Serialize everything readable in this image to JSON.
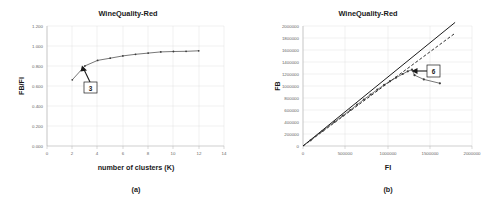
{
  "figure": {
    "name": "two-panel-figure",
    "background_color": "#ffffff",
    "text_color": "#1a1a1a",
    "grid_color": "#d9d9d9",
    "series_color": "#3c3c3c"
  },
  "chart_data": [
    {
      "panel": "a",
      "type": "line",
      "title": "WineQuality-Red",
      "caption": "(a)",
      "xlabel": "number of clusters (K)",
      "ylabel": "FB/FI",
      "xlim": [
        0,
        14
      ],
      "ylim": [
        0.0,
        1.2
      ],
      "grid": true,
      "legend": "none",
      "xticks": [
        0,
        2,
        4,
        6,
        8,
        10,
        12,
        14
      ],
      "xtick_labels": [
        "0",
        "2",
        "4",
        "6",
        "8",
        "10",
        "12",
        "14"
      ],
      "yticks": [
        0.0,
        0.2,
        0.4,
        0.6,
        0.8,
        1.0,
        1.2
      ],
      "ytick_labels": [
        "0.000",
        "0.200",
        "0.400",
        "0.600",
        "0.800",
        "1.000",
        "1.200"
      ],
      "x": [
        2,
        3,
        4,
        5,
        6,
        7,
        8,
        9,
        10,
        11,
        12
      ],
      "values": [
        0.662,
        0.801,
        0.856,
        0.878,
        0.901,
        0.917,
        0.929,
        0.941,
        0.945,
        0.947,
        0.952
      ],
      "series": [
        {
          "name": "FB/FI",
          "x": [
            2,
            3,
            4,
            5,
            6,
            7,
            8,
            9,
            10,
            11,
            12
          ],
          "values": [
            0.662,
            0.801,
            0.856,
            0.878,
            0.901,
            0.917,
            0.929,
            0.941,
            0.945,
            0.947,
            0.952
          ]
        }
      ],
      "annotations": [
        {
          "label": "3",
          "points_to_x": 3,
          "points_to_y": 0.801,
          "box_x": 3.55,
          "box_y": 0.565
        }
      ]
    },
    {
      "panel": "b",
      "type": "line",
      "title": "WineQuality-Red",
      "caption": "(b)",
      "xlabel": "FI",
      "ylabel": "FB",
      "xlim": [
        0,
        2000000
      ],
      "ylim": [
        0,
        2000000
      ],
      "grid": true,
      "legend": "none",
      "xticks": [
        0,
        500000,
        1000000,
        1500000,
        2000000
      ],
      "xtick_labels": [
        "0",
        "500000",
        "1000000",
        "1500000",
        "2000000"
      ],
      "yticks": [
        0,
        200000,
        400000,
        600000,
        800000,
        1000000,
        1200000,
        1400000,
        1600000,
        1800000,
        2000000
      ],
      "ytick_labels": [
        "0",
        "200000",
        "400000",
        "600000",
        "800000",
        "1000000",
        "1200000",
        "1400000",
        "1600000",
        "1800000",
        "2000000"
      ],
      "series": [
        {
          "name": "reference-solid",
          "style": "solid",
          "x": [
            0,
            1800000
          ],
          "values": [
            0,
            2060000
          ]
        },
        {
          "name": "reference-dashed",
          "style": "dashed",
          "x": [
            0,
            1800000
          ],
          "values": [
            0,
            1880000
          ]
        },
        {
          "name": "FB-vs-FI",
          "style": "markers",
          "x": [
            90000,
            230000,
            370000,
            470000,
            560000,
            640000,
            720000,
            800000,
            880000,
            960000,
            1030000,
            1100000,
            1180000,
            1240000,
            1290000,
            1320000,
            1430000,
            1620000
          ],
          "values": [
            95000,
            250000,
            400000,
            505000,
            600000,
            688000,
            775000,
            858000,
            940000,
            1018000,
            1080000,
            1138000,
            1200000,
            1245000,
            1272000,
            1180000,
            1110000,
            1045000
          ]
        }
      ],
      "annotations": [
        {
          "label": "6",
          "points_to_x": 1300000,
          "points_to_y": 1270000,
          "box_x": 1510000,
          "box_y": 1290000
        }
      ]
    }
  ]
}
